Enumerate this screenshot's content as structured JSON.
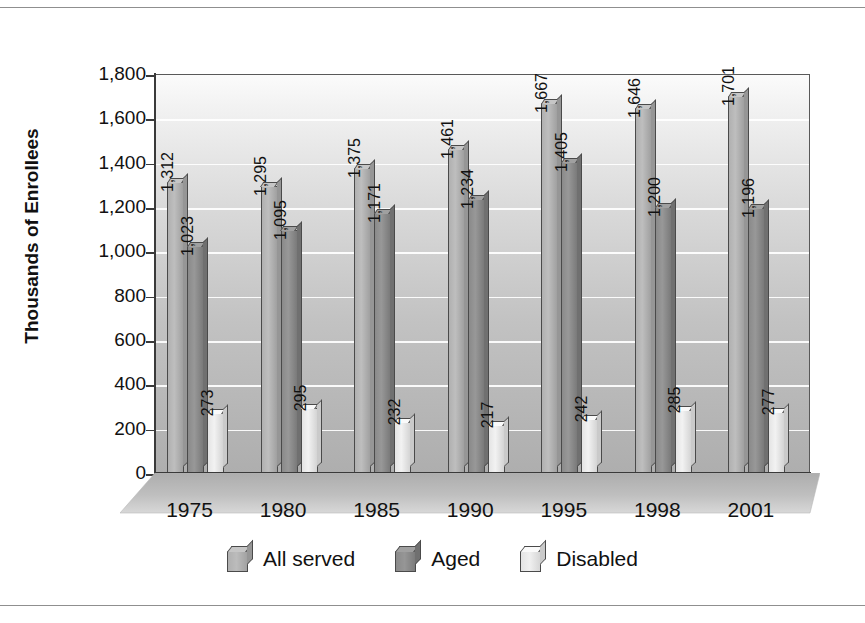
{
  "chart_data": {
    "type": "bar",
    "title": "",
    "xlabel": "",
    "ylabel": "Thousands of Enrollees",
    "ylim": [
      0,
      1800
    ],
    "ytick_step": 200,
    "grid": true,
    "legend_position": "bottom",
    "categories": [
      "1975",
      "1980",
      "1985",
      "1990",
      "1995",
      "1998",
      "2001"
    ],
    "ytick_labels": [
      "0",
      "200",
      "400",
      "600",
      "800",
      "1,000",
      "1,200",
      "1,400",
      "1,600",
      "1,800"
    ],
    "series": [
      {
        "name": "All served",
        "color": "#b0b0b0",
        "values": [
          1312,
          1295,
          1375,
          1461,
          1667,
          1646,
          1701
        ],
        "labels": [
          "1,312",
          "1,295",
          "1,375",
          "1,461",
          "1,667",
          "1,646",
          "1,701"
        ]
      },
      {
        "name": "Aged",
        "color": "#8a8a8a",
        "values": [
          1023,
          1095,
          1171,
          1234,
          1405,
          1200,
          1196
        ],
        "labels": [
          "1,023",
          "1,095",
          "1,171",
          "1,234",
          "1,405",
          "1,200",
          "1,196"
        ]
      },
      {
        "name": "Disabled",
        "color": "#e4e4e4",
        "values": [
          273,
          295,
          232,
          217,
          242,
          285,
          277
        ],
        "labels": [
          "273",
          "295",
          "232",
          "217",
          "242",
          "285",
          "277"
        ]
      }
    ]
  },
  "legend": {
    "items": [
      {
        "label": "All served",
        "color": "#b0b0b0"
      },
      {
        "label": "Aged",
        "color": "#8a8a8a"
      },
      {
        "label": "Disabled",
        "color": "#e4e4e4"
      }
    ]
  },
  "colors": {
    "all_served": "#b0b0b0",
    "aged": "#8a8a8a",
    "disabled": "#e4e4e4",
    "axis": "#3a3a3a",
    "gridline": "#ffffff",
    "floor": "#b6b6b6",
    "frame_rule": "#8f8f8f"
  }
}
